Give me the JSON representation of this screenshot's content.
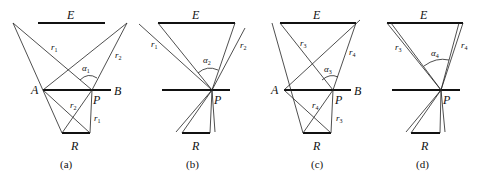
{
  "figure": {
    "panels": [
      {
        "id": "a",
        "caption": "(a)",
        "labels": {
          "E": "E",
          "A": "A",
          "B": "B",
          "P": "P",
          "R": "R",
          "upper_left_ray": {
            "base": "r",
            "sub": "1"
          },
          "upper_right_ray": {
            "base": "r",
            "sub": "2"
          },
          "lower_diag_ray": {
            "base": "r",
            "sub": "2"
          },
          "lower_vert_ray": {
            "base": "r",
            "sub": "1"
          },
          "angle": {
            "base": "α",
            "sub": "1"
          }
        }
      },
      {
        "id": "b",
        "caption": "(b)",
        "labels": {
          "E": "E",
          "P": "P",
          "R": "R",
          "upper_left_ray": {
            "base": "r",
            "sub": "1"
          },
          "upper_right_ray": {
            "base": "r",
            "sub": "2"
          },
          "angle": {
            "base": "α",
            "sub": "2"
          }
        }
      },
      {
        "id": "c",
        "caption": "(c)",
        "labels": {
          "E": "E",
          "A": "A",
          "B": "B",
          "P": "P",
          "R": "R",
          "upper_left_ray": {
            "base": "r",
            "sub": "3"
          },
          "upper_right_ray": {
            "base": "r",
            "sub": "4"
          },
          "lower_diag_ray": {
            "base": "r",
            "sub": "4"
          },
          "lower_vert_ray": {
            "base": "r",
            "sub": "3"
          },
          "angle": {
            "base": "α",
            "sub": "3"
          }
        }
      },
      {
        "id": "d",
        "caption": "(d)",
        "labels": {
          "E": "E",
          "P": "P",
          "R": "R",
          "upper_left_ray": {
            "base": "r",
            "sub": "3"
          },
          "upper_right_ray": {
            "base": "r",
            "sub": "4"
          },
          "angle": {
            "base": "α",
            "sub": "4"
          }
        }
      }
    ]
  }
}
